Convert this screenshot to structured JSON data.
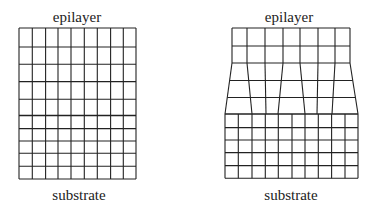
{
  "diagram": {
    "left_panel": {
      "title": "Lattice-matched (coherent) interface",
      "top_label": "epilayer",
      "bottom_label": "substrate",
      "epilayer": {
        "columns": 9,
        "rows": 5
      },
      "substrate": {
        "columns": 9,
        "rows": 5
      }
    },
    "right_panel": {
      "title": "Lattice-mismatched interface",
      "top_label": "epilayer",
      "bottom_label": "substrate",
      "epilayer": {
        "columns": 7,
        "rows": 5,
        "note": "upper 2 rows rectangular, lower 3 rows distorted (tapering outward to substrate width)"
      },
      "substrate": {
        "columns": 10,
        "rows": 5
      }
    },
    "colors": {
      "line": "#222222",
      "background": "#ffffff"
    }
  }
}
